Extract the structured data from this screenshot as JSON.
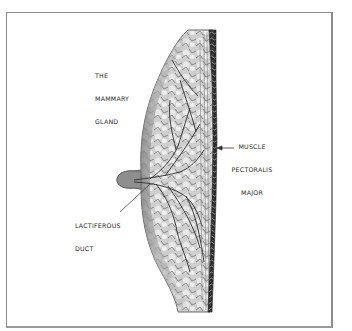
{
  "figure": {
    "title": "The Mammary Gland",
    "frame_color": "#8c8c8c",
    "colors": {
      "tissue_light": "#d9d9d9",
      "tissue_mid": "#9a9a9a",
      "tissue_dark": "#3c3c3c",
      "skin_edge": "#6e6e6e",
      "muscle_dark": "#2b2b2b"
    }
  },
  "labels": {
    "gland": [
      "THE",
      "MAMMARY",
      "GLAND"
    ],
    "muscle": [
      "MUSCLE",
      "PECTORALIS",
      "MAJOR"
    ],
    "duct": [
      "LACTIFEROUS",
      "DUCT"
    ]
  }
}
